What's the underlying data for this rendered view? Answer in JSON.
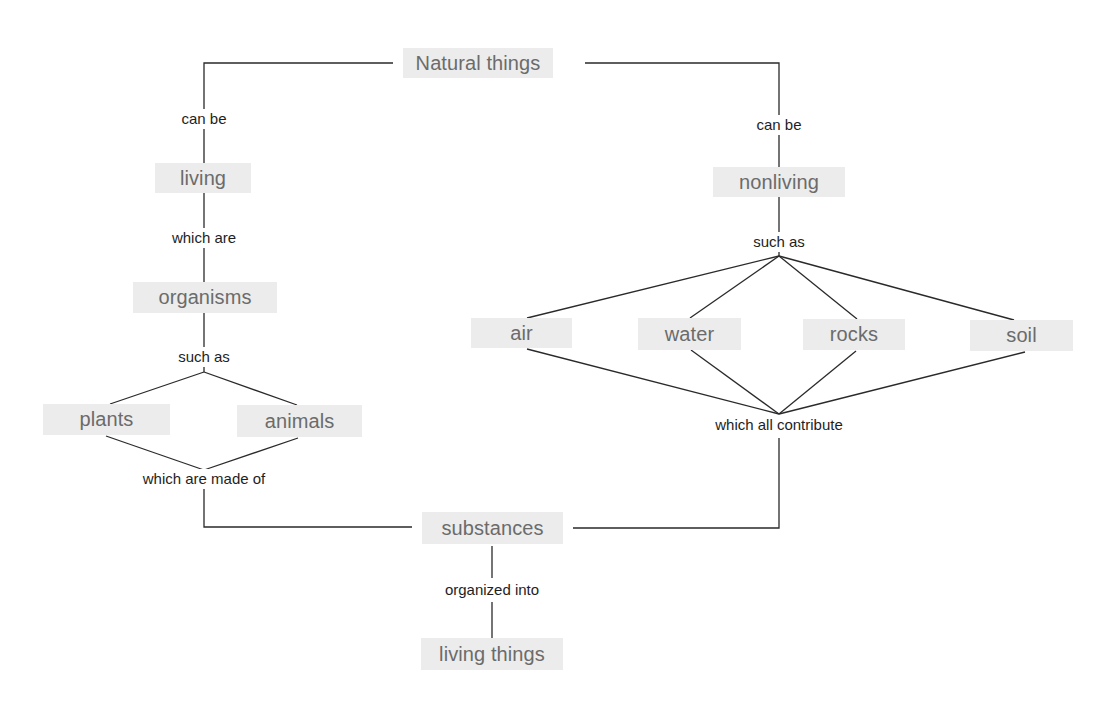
{
  "diagram": {
    "type": "concept-map",
    "colors": {
      "concept_bg": "#ececec",
      "concept_text": "#6b6b6b",
      "link_text": "#1e1e1e",
      "line": "#2a2a2a"
    },
    "concepts": {
      "natural_things": "Natural things",
      "living": "living",
      "organisms": "organisms",
      "plants": "plants",
      "animals": "animals",
      "nonliving": "nonliving",
      "air": "air",
      "water": "water",
      "rocks": "rocks",
      "soil": "soil",
      "substances": "substances",
      "living_things": "living things"
    },
    "links": {
      "can_be_left": "can be",
      "which_are": "which are",
      "such_as_left": "such as",
      "which_are_made_of": "which are made of",
      "can_be_right": "can be",
      "such_as_right": "such as",
      "which_all_contribute": "which all contribute",
      "organized_into": "organized into"
    },
    "edges": [
      {
        "from": "Natural things",
        "via": "can be",
        "to": "living"
      },
      {
        "from": "Natural things",
        "via": "can be",
        "to": "nonliving"
      },
      {
        "from": "living",
        "via": "which are",
        "to": "organisms"
      },
      {
        "from": "organisms",
        "via": "such as",
        "to": [
          "plants",
          "animals"
        ]
      },
      {
        "from": [
          "plants",
          "animals"
        ],
        "via": "which are made of",
        "to": "substances"
      },
      {
        "from": "nonliving",
        "via": "such as",
        "to": [
          "air",
          "water",
          "rocks",
          "soil"
        ]
      },
      {
        "from": [
          "air",
          "water",
          "rocks",
          "soil"
        ],
        "via": "which all contribute",
        "to": "substances"
      },
      {
        "from": "substances",
        "via": "organized into",
        "to": "living things"
      }
    ]
  }
}
